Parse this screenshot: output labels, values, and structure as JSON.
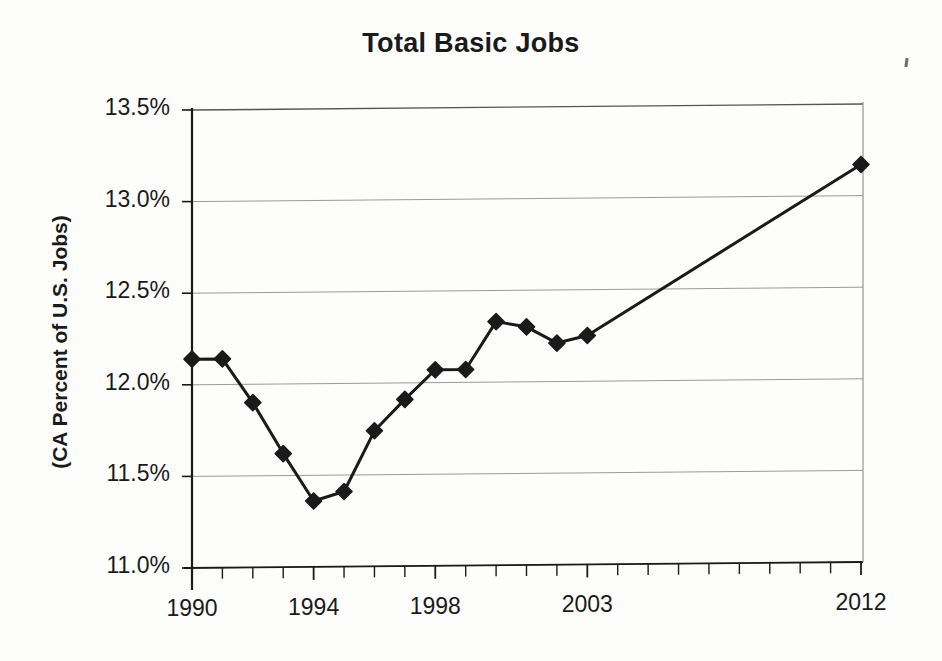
{
  "chart_data": {
    "type": "line",
    "title": "Total Basic Jobs",
    "xlabel": "",
    "ylabel": "(CA Percent of U.S. Jobs)",
    "ylim": [
      11.0,
      13.5
    ],
    "xlim": [
      1990,
      2012
    ],
    "grid": true,
    "legend": "none",
    "marker": "filled-diamond",
    "line_color": "#1a1a1a",
    "grid_color": "#9a9a9a",
    "y_tick_labels": [
      "11.0%",
      "11.5%",
      "12.0%",
      "12.5%",
      "13.0%",
      "13.5%"
    ],
    "y_tick_values": [
      11.0,
      11.5,
      12.0,
      12.5,
      13.0,
      13.5
    ],
    "x_tick_labels": [
      "1990",
      "1994",
      "1998",
      "2003",
      "2012"
    ],
    "x_tick_values": [
      1990,
      1994,
      1998,
      2003,
      2012
    ],
    "x_minor_tick_step": 1,
    "x": [
      1990,
      1991,
      1992,
      1993,
      1994,
      1995,
      1996,
      1997,
      1998,
      1999,
      2000,
      2001,
      2002,
      2003,
      2012
    ],
    "values": [
      12.14,
      12.14,
      11.9,
      11.62,
      11.36,
      11.41,
      11.74,
      11.91,
      12.07,
      12.07,
      12.33,
      12.3,
      12.21,
      12.25,
      13.17
    ],
    "series": [
      {
        "name": "Total Basic Jobs",
        "values": [
          12.14,
          12.14,
          11.9,
          11.62,
          11.36,
          11.41,
          11.74,
          11.91,
          12.07,
          12.07,
          12.33,
          12.3,
          12.21,
          12.25,
          13.17
        ]
      }
    ],
    "annotations": []
  },
  "page": {
    "title": "Total Basic Jobs",
    "y_axis_title": "(CA Percent of U.S. Jobs)"
  }
}
